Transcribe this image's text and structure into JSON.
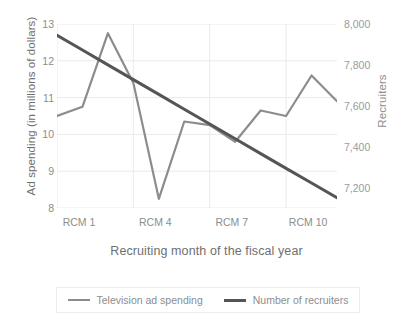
{
  "chart_data": {
    "type": "line",
    "title": "",
    "xlabel": "Recruiting month of the fiscal year",
    "ylabel": "Ad spending (in millions of dollars)",
    "ylabel_right": "Recruiters",
    "grid": true,
    "legend_position": "bottom",
    "categories": [
      "RCM 1",
      "RCM 2",
      "RCM 3",
      "RCM 4",
      "RCM 5",
      "RCM 6",
      "RCM 7",
      "RCM 8",
      "RCM 9",
      "RCM 10",
      "RCM 11",
      "RCM 12"
    ],
    "xtick_labels": [
      "RCM 1",
      "RCM 4",
      "RCM 7",
      "RCM 10"
    ],
    "xtick_indices": [
      0,
      3,
      6,
      9
    ],
    "ylim": [
      8,
      13
    ],
    "ytick_labels": [
      "8",
      "9",
      "10",
      "11",
      "12",
      "13"
    ],
    "ytick_values": [
      8,
      9,
      10,
      11,
      12,
      13
    ],
    "ylim_right": [
      7100,
      8000
    ],
    "ytick_labels_right": [
      "7,200",
      "7,400",
      "7,600",
      "7,800",
      "8,000"
    ],
    "ytick_values_right": [
      7200,
      7400,
      7600,
      7800,
      8000
    ],
    "series": [
      {
        "name": "Television ad spending",
        "axis": "left",
        "color": "#8c8c8c",
        "values": [
          10.5,
          10.75,
          12.75,
          11.4,
          8.25,
          10.35,
          10.25,
          9.8,
          10.65,
          10.5,
          11.6,
          10.9
        ]
      },
      {
        "name": "Number of recruiters",
        "axis": "right",
        "color": "#555555",
        "values": [
          7945,
          7873,
          7800,
          7728,
          7656,
          7583,
          7511,
          7439,
          7366,
          7294,
          7222,
          7150
        ]
      }
    ]
  },
  "legend": {
    "items": [
      {
        "label": "Television ad spending",
        "color": "#8c8c8c",
        "width": "2.2px"
      },
      {
        "label": "Number of recruiters",
        "color": "#555555",
        "width": "3px"
      }
    ]
  }
}
